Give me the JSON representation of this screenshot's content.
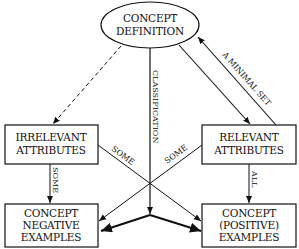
{
  "nodes": {
    "definition": {
      "lines": [
        "CONCEPT",
        "DEFINITION"
      ]
    },
    "irrelevant": {
      "lines": [
        "IRRELEVANT",
        "ATTRIBUTES"
      ]
    },
    "relevant": {
      "lines": [
        "RELEVANT",
        "ATTRIBUTES"
      ]
    },
    "negative": {
      "lines": [
        "CONCEPT",
        "NEGATIVE",
        "EXAMPLES"
      ]
    },
    "positive": {
      "lines": [
        "CONCEPT",
        "(POSITIVE)",
        "EXAMPLES"
      ]
    }
  },
  "edges": {
    "classification": {
      "label": "CLASSIFICATION"
    },
    "minimal_set": {
      "label": "A MINIMAL SET"
    },
    "irrelevant_to_negative": {
      "label": "SOME"
    },
    "relevant_to_positive": {
      "label": "ALL"
    },
    "irrelevant_to_positive": {
      "label": "SOME"
    },
    "relevant_to_negative": {
      "label": "SOME"
    }
  },
  "colors": {
    "stroke": "#111111",
    "background": "#ffffff"
  }
}
